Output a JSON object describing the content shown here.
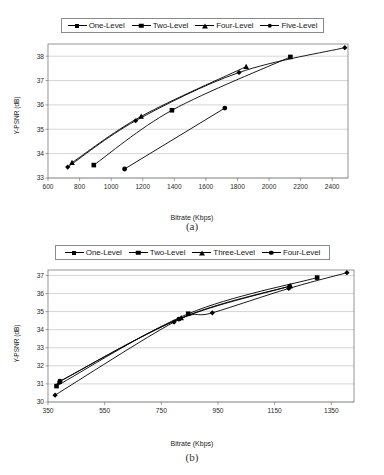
{
  "figures": [
    {
      "id": "a",
      "caption": "(a)",
      "legend": [
        {
          "label": "One-Level",
          "marker": "diamond"
        },
        {
          "label": "Two-Level",
          "marker": "square"
        },
        {
          "label": "Four-Level",
          "marker": "triangle"
        },
        {
          "label": "Five-Level",
          "marker": "circle"
        }
      ]
    },
    {
      "id": "b",
      "caption": "(b)",
      "legend": [
        {
          "label": "One-Level",
          "marker": "diamond"
        },
        {
          "label": "Two-Level",
          "marker": "square"
        },
        {
          "label": "Three-Level",
          "marker": "triangle"
        },
        {
          "label": "Four-Level",
          "marker": "circle"
        }
      ]
    }
  ],
  "chart_data": [
    {
      "type": "line",
      "id": "a",
      "title": "",
      "xlabel": "Bitrate (Kbps)",
      "ylabel": "Y-PSNR (dB)",
      "xlim": [
        600,
        2500
      ],
      "ylim": [
        33,
        38.5
      ],
      "xticks": [
        600,
        800,
        1000,
        1200,
        1400,
        1600,
        1800,
        2000,
        2200,
        2400
      ],
      "yticks": [
        33,
        34,
        35,
        36,
        37,
        38
      ],
      "grid": true,
      "legend_position": "top",
      "series": [
        {
          "name": "One-Level",
          "marker": "diamond",
          "x": [
            725,
            1155,
            1810,
            2480
          ],
          "y": [
            33.45,
            35.35,
            37.33,
            38.35
          ]
        },
        {
          "name": "Two-Level",
          "marker": "square",
          "x": [
            890,
            1385,
            2135
          ],
          "y": [
            33.53,
            35.78,
            37.97
          ]
        },
        {
          "name": "Four-Level",
          "marker": "triangle",
          "x": [
            752,
            1190,
            1855
          ],
          "y": [
            33.63,
            35.53,
            37.57
          ]
        },
        {
          "name": "Five-Level",
          "marker": "circle",
          "x": [
            1085,
            1720
          ],
          "y": [
            33.37,
            35.87
          ]
        }
      ]
    },
    {
      "type": "line",
      "id": "b",
      "title": "",
      "xlabel": "Bitrate (Kbps)",
      "ylabel": "Y-PSNR (dB)",
      "xlim": [
        350,
        1430
      ],
      "ylim": [
        30,
        37.3
      ],
      "xticks": [
        350,
        550,
        750,
        950,
        1150,
        1350
      ],
      "yticks": [
        30,
        31,
        32,
        33,
        34,
        35,
        36,
        37
      ],
      "grid": true,
      "legend_position": "top",
      "series": [
        {
          "name": "One-Level",
          "marker": "diamond",
          "x": [
            375,
            795,
            930,
            1200,
            1405
          ],
          "y": [
            30.38,
            34.42,
            34.93,
            36.28,
            37.15
          ]
        },
        {
          "name": "Two-Level",
          "marker": "square",
          "x": [
            380,
            845,
            1300
          ],
          "y": [
            30.88,
            34.88,
            36.88
          ]
        },
        {
          "name": "Three-Level",
          "marker": "triangle",
          "x": [
            390,
            820,
            1205
          ],
          "y": [
            31.12,
            34.65,
            36.42
          ]
        },
        {
          "name": "Four-Level",
          "marker": "circle",
          "x": [
            392,
            812,
            1203
          ],
          "y": [
            31.15,
            34.58,
            36.4
          ]
        }
      ]
    }
  ]
}
